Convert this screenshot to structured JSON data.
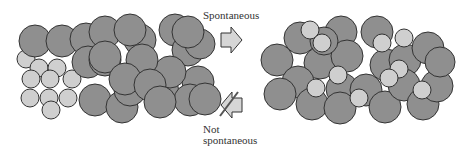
{
  "labels": {
    "forward": "Spontaneous",
    "reverse_line1": "Not",
    "reverse_line2": "spontaneous"
  },
  "colors": {
    "large_particle": "#8f8f8f",
    "small_particle": "#cfcfcf",
    "outline": "#333333",
    "arrow_fill": "#d6d6d6"
  },
  "left_state": {
    "description": "Separated: large particles packed together, small particles packed together"
  },
  "right_state": {
    "description": "Mixed: small particles dispersed among large particles"
  }
}
